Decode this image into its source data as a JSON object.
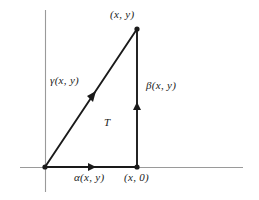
{
  "figure": {
    "title_alt": "Triangular region T with boundary paths alpha, beta, gamma",
    "background_color": "#ffffff",
    "axis_color": "#9a9a9a",
    "curve_color": "#1a1a1a",
    "labels": {
      "apex_point": "(x, y)",
      "hypotenuse_path": "γ(x, y)",
      "vertical_path": "β(x, y)",
      "region": "T",
      "horizontal_path": "α(x, y)",
      "foot_point": "(x, 0)"
    },
    "geometry": {
      "origin": [
        45,
        167
      ],
      "foot": [
        137,
        167
      ],
      "apex": [
        137,
        29
      ],
      "x_axis": [
        20,
        167,
        243,
        167
      ],
      "y_axis": [
        45,
        10,
        45,
        192
      ],
      "arrow_horizontal_at": [
        93,
        167
      ],
      "arrow_vertical_at": [
        137,
        106
      ],
      "arrow_hypotenuse_at": [
        92,
        97
      ]
    }
  }
}
